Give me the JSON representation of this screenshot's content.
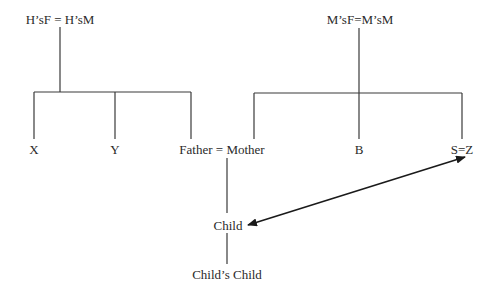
{
  "diagram": {
    "type": "kinship-tree",
    "nodes": {
      "h_parents": "H’sF = H’sM",
      "m_parents": "M’sF=M’sM",
      "x": "X",
      "y": "Y",
      "father_mother": "Father = Mother",
      "b": "B",
      "s_z": "S=Z",
      "child": "Child",
      "childs_child": "Child’s Child"
    },
    "edges": [
      {
        "from": "h_parents",
        "to": [
          "x",
          "y",
          "father_mother"
        ],
        "type": "descent"
      },
      {
        "from": "m_parents",
        "to": [
          "father_mother",
          "b",
          "s_z"
        ],
        "type": "descent"
      },
      {
        "from": "father_mother",
        "to": "child",
        "type": "descent"
      },
      {
        "from": "child",
        "to": "childs_child",
        "type": "descent"
      },
      {
        "from": "child",
        "to": "s_z",
        "type": "double-arrow"
      }
    ],
    "line_color": "#333333"
  }
}
